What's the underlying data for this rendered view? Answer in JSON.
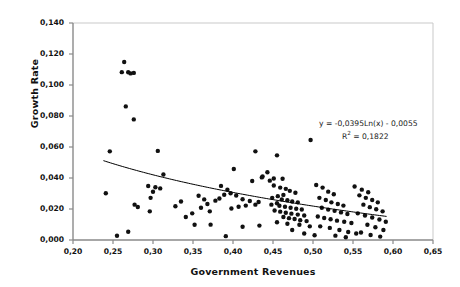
{
  "chart_data": {
    "type": "scatter",
    "title": "",
    "xlabel": "Government Revenues",
    "ylabel": "Growth Rate",
    "xlim": [
      0.2,
      0.65
    ],
    "ylim": [
      0.0,
      0.14
    ],
    "xticks": [
      "0,20",
      "0,25",
      "0,30",
      "0,35",
      "0,40",
      "0,45",
      "0,50",
      "0,55",
      "0,60",
      "0,65"
    ],
    "xtick_values": [
      0.2,
      0.25,
      0.3,
      0.35,
      0.4,
      0.45,
      0.5,
      0.55,
      0.6,
      0.65
    ],
    "yticks": [
      "0,000",
      "0,020",
      "0,040",
      "0,060",
      "0,080",
      "0,100",
      "0,120",
      "0,140"
    ],
    "ytick_values": [
      0.0,
      0.02,
      0.04,
      0.06,
      0.08,
      0.1,
      0.12,
      0.14
    ],
    "grid": false,
    "legend": "none",
    "marker": "filled-circle",
    "marker_color": "#111111",
    "marker_size": 2.2,
    "annotations": [
      {
        "name": "regression-equation",
        "text": "y = -0,0395Ln(x) - 0,0055",
        "x": 0.5,
        "y": 0.0655
      },
      {
        "name": "r-squared",
        "text": "R² = 0,1822",
        "x": 0.505,
        "y": 0.0585
      }
    ],
    "trendline": {
      "type": "logarithmic",
      "equation": "y = -0,0395Ln(x) - 0,0055",
      "slope_coefficient": -0.0395,
      "intercept": -0.0055,
      "r_squared": 0.1822,
      "x_start": 0.238,
      "x_end": 0.592,
      "color": "#000000",
      "width": 1.0
    },
    "points": [
      [
        0.264,
        0.1148
      ],
      [
        0.261,
        0.1083
      ],
      [
        0.269,
        0.1082
      ],
      [
        0.276,
        0.1078
      ],
      [
        0.272,
        0.1075
      ],
      [
        0.266,
        0.0862
      ],
      [
        0.276,
        0.0778
      ],
      [
        0.246,
        0.0572
      ],
      [
        0.306,
        0.0575
      ],
      [
        0.428,
        0.0572
      ],
      [
        0.455,
        0.0546
      ],
      [
        0.401,
        0.0458
      ],
      [
        0.443,
        0.0437
      ],
      [
        0.313,
        0.0423
      ],
      [
        0.437,
        0.041
      ],
      [
        0.436,
        0.0404
      ],
      [
        0.451,
        0.0397
      ],
      [
        0.462,
        0.0395
      ],
      [
        0.424,
        0.0381
      ],
      [
        0.241,
        0.0302
      ],
      [
        0.294,
        0.0348
      ],
      [
        0.303,
        0.034
      ],
      [
        0.309,
        0.0333
      ],
      [
        0.3,
        0.0311
      ],
      [
        0.297,
        0.0272
      ],
      [
        0.277,
        0.0228
      ],
      [
        0.281,
        0.0213
      ],
      [
        0.296,
        0.0185
      ],
      [
        0.255,
        0.0027
      ],
      [
        0.269,
        0.0053
      ],
      [
        0.385,
        0.0349
      ],
      [
        0.393,
        0.0325
      ],
      [
        0.397,
        0.0302
      ],
      [
        0.389,
        0.0292
      ],
      [
        0.383,
        0.0268
      ],
      [
        0.378,
        0.0254
      ],
      [
        0.404,
        0.0287
      ],
      [
        0.412,
        0.0263
      ],
      [
        0.421,
        0.0252
      ],
      [
        0.432,
        0.0245
      ],
      [
        0.428,
        0.0228
      ],
      [
        0.416,
        0.0222
      ],
      [
        0.407,
        0.0215
      ],
      [
        0.398,
        0.0203
      ],
      [
        0.372,
        0.0099
      ],
      [
        0.391,
        0.0025
      ],
      [
        0.412,
        0.0085
      ],
      [
        0.433,
        0.0093
      ],
      [
        0.446,
        0.0383
      ],
      [
        0.451,
        0.0352
      ],
      [
        0.459,
        0.0338
      ],
      [
        0.466,
        0.033
      ],
      [
        0.471,
        0.0317
      ],
      [
        0.478,
        0.0305
      ],
      [
        0.463,
        0.0291
      ],
      [
        0.456,
        0.0283
      ],
      [
        0.449,
        0.0272
      ],
      [
        0.461,
        0.0262
      ],
      [
        0.468,
        0.0256
      ],
      [
        0.474,
        0.0248
      ],
      [
        0.481,
        0.0243
      ],
      [
        0.455,
        0.0237
      ],
      [
        0.448,
        0.0228
      ],
      [
        0.458,
        0.0221
      ],
      [
        0.465,
        0.0215
      ],
      [
        0.472,
        0.0208
      ],
      [
        0.479,
        0.0202
      ],
      [
        0.486,
        0.0197
      ],
      [
        0.452,
        0.019
      ],
      [
        0.459,
        0.0183
      ],
      [
        0.466,
        0.0176
      ],
      [
        0.473,
        0.017
      ],
      [
        0.481,
        0.0164
      ],
      [
        0.489,
        0.0158
      ],
      [
        0.463,
        0.0148
      ],
      [
        0.47,
        0.0141
      ],
      [
        0.477,
        0.0135
      ],
      [
        0.484,
        0.0128
      ],
      [
        0.492,
        0.0122
      ],
      [
        0.455,
        0.0115
      ],
      [
        0.468,
        0.0105
      ],
      [
        0.483,
        0.0098
      ],
      [
        0.496,
        0.0088
      ],
      [
        0.474,
        0.0065
      ],
      [
        0.489,
        0.0042
      ],
      [
        0.502,
        0.0031
      ],
      [
        0.504,
        0.0355
      ],
      [
        0.512,
        0.0338
      ],
      [
        0.519,
        0.0312
      ],
      [
        0.526,
        0.0295
      ],
      [
        0.508,
        0.0272
      ],
      [
        0.516,
        0.0258
      ],
      [
        0.523,
        0.0243
      ],
      [
        0.531,
        0.0232
      ],
      [
        0.538,
        0.0222
      ],
      [
        0.511,
        0.0208
      ],
      [
        0.519,
        0.0196
      ],
      [
        0.527,
        0.0188
      ],
      [
        0.535,
        0.0178
      ],
      [
        0.543,
        0.0168
      ],
      [
        0.506,
        0.0152
      ],
      [
        0.514,
        0.0142
      ],
      [
        0.522,
        0.0134
      ],
      [
        0.53,
        0.0125
      ],
      [
        0.539,
        0.0118
      ],
      [
        0.548,
        0.011
      ],
      [
        0.509,
        0.0088
      ],
      [
        0.521,
        0.0078
      ],
      [
        0.533,
        0.0065
      ],
      [
        0.544,
        0.0052
      ],
      [
        0.554,
        0.0042
      ],
      [
        0.528,
        0.0028
      ],
      [
        0.541,
        0.0018
      ],
      [
        0.552,
        0.0345
      ],
      [
        0.561,
        0.0325
      ],
      [
        0.569,
        0.0308
      ],
      [
        0.558,
        0.0288
      ],
      [
        0.566,
        0.0272
      ],
      [
        0.574,
        0.0258
      ],
      [
        0.581,
        0.0243
      ],
      [
        0.563,
        0.0228
      ],
      [
        0.571,
        0.0212
      ],
      [
        0.579,
        0.0198
      ],
      [
        0.587,
        0.0185
      ],
      [
        0.556,
        0.0172
      ],
      [
        0.565,
        0.0158
      ],
      [
        0.574,
        0.0145
      ],
      [
        0.583,
        0.0132
      ],
      [
        0.591,
        0.0118
      ],
      [
        0.568,
        0.0098
      ],
      [
        0.578,
        0.0082
      ],
      [
        0.588,
        0.0065
      ],
      [
        0.56,
        0.0048
      ],
      [
        0.572,
        0.0032
      ],
      [
        0.584,
        0.0022
      ],
      [
        0.497,
        0.0645
      ],
      [
        0.341,
        0.0148
      ],
      [
        0.352,
        0.0098
      ],
      [
        0.357,
        0.0285
      ],
      [
        0.364,
        0.0262
      ],
      [
        0.368,
        0.0232
      ],
      [
        0.36,
        0.0208
      ],
      [
        0.371,
        0.0185
      ],
      [
        0.349,
        0.0172
      ],
      [
        0.335,
        0.0248
      ],
      [
        0.328,
        0.0218
      ]
    ]
  },
  "axes": {
    "y_axis_name": "growth-rate-axis",
    "x_axis_name": "government-revenues-axis"
  }
}
